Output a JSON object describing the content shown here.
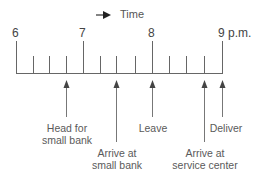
{
  "diagram": {
    "direction_label": "Time",
    "hours": [
      {
        "label": "6",
        "x": 16
      },
      {
        "label": "7",
        "x": 83
      },
      {
        "label": "8",
        "x": 152
      },
      {
        "label": "9 p.m.",
        "x": 222
      }
    ],
    "minor_tick_xs": [
      33,
      49,
      66,
      100,
      116,
      135,
      169,
      186,
      204
    ],
    "events": [
      {
        "label_line1": "Head for",
        "label_line2": "small bank",
        "x": 66
      },
      {
        "label_line1": "Arrive at",
        "label_line2": "small bank",
        "x": 116
      },
      {
        "label_line1": "Leave",
        "label_line2": "",
        "x": 152
      },
      {
        "label_line1": "Arrive at",
        "label_line2": "service center",
        "x": 204
      },
      {
        "label_line1": "Deliver",
        "label_line2": "",
        "x": 222
      }
    ],
    "colors": {
      "axis": "#555555",
      "arrow": "#666666",
      "text": "#5a5a5a"
    }
  }
}
